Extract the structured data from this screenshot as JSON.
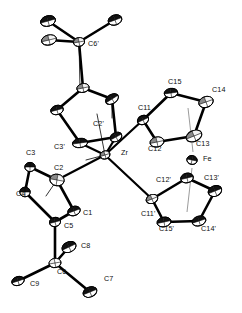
{
  "figure": {
    "kind": "ortep-crystal-structure-diagram",
    "title": "",
    "caption": "",
    "background_color": "#ffffff",
    "line_color": "#000000",
    "label_color": "#0d0d0d",
    "shading_colors": {
      "dark": "#121212",
      "mid": "#8a8a8a",
      "light": "#f2f2f2",
      "white": "#ffffff"
    }
  },
  "structure": {
    "metal_centers": [
      "Zr",
      "Fe"
    ],
    "label_count": 22,
    "atoms": [
      {
        "id": "Zr",
        "label": "Zr",
        "label_x": 121,
        "label_y": 155,
        "x": 105,
        "y": 155,
        "rx": 5.0,
        "ry": 4.0,
        "rot": -18,
        "fill": "mid",
        "kind": "metal"
      },
      {
        "id": "Fe",
        "label": "Fe",
        "label_x": 203,
        "label_y": 161,
        "x": 192,
        "y": 160,
        "rx": 5.2,
        "ry": 4.4,
        "rot": 12,
        "fill": "dark",
        "kind": "metal"
      },
      {
        "id": "C1",
        "label": "C1",
        "label_x": 83,
        "label_y": 215,
        "x": 74,
        "y": 211,
        "rx": 6.4,
        "ry": 4.6,
        "rot": -20,
        "fill": "dark",
        "kind": "ring-cp-lower"
      },
      {
        "id": "C2",
        "label": "C2",
        "label_x": 54,
        "label_y": 170,
        "x": 57,
        "y": 180,
        "rx": 7.2,
        "ry": 5.8,
        "rot": 10,
        "fill": "mid",
        "kind": "ring-cp-lower"
      },
      {
        "id": "C3",
        "label": "C3",
        "label_x": 26,
        "label_y": 155,
        "x": 30,
        "y": 167,
        "rx": 5.2,
        "ry": 4.6,
        "rot": 0,
        "fill": "dark",
        "kind": "ring-cp-lower"
      },
      {
        "id": "C4",
        "label": "C4",
        "label_x": 16,
        "label_y": 196,
        "x": 25,
        "y": 192,
        "rx": 5.2,
        "ry": 4.8,
        "rot": 0,
        "fill": "dark",
        "kind": "ring-cp-lower"
      },
      {
        "id": "C5",
        "label": "C5",
        "label_x": 64,
        "label_y": 228,
        "x": 55,
        "y": 222,
        "rx": 5.6,
        "ry": 4.6,
        "rot": -15,
        "fill": "dark",
        "kind": "ring-cp-lower"
      },
      {
        "id": "C6",
        "label": "C6",
        "label_x": 57,
        "label_y": 274,
        "x": 55,
        "y": 263,
        "rx": 6.0,
        "ry": 4.6,
        "rot": -10,
        "fill": "light",
        "kind": "tbu-lower"
      },
      {
        "id": "C7",
        "label": "C7",
        "label_x": 104,
        "label_y": 281,
        "x": 90,
        "y": 292,
        "rx": 7.2,
        "ry": 5.0,
        "rot": -22,
        "fill": "dark",
        "kind": "tbu-lower"
      },
      {
        "id": "C8",
        "label": "C8",
        "label_x": 81,
        "label_y": 248,
        "x": 69,
        "y": 247,
        "rx": 7.4,
        "ry": 5.2,
        "rot": -25,
        "fill": "dark",
        "kind": "tbu-lower"
      },
      {
        "id": "C9",
        "label": "C9",
        "label_x": 30,
        "label_y": 286,
        "x": 18,
        "y": 281,
        "rx": 6.4,
        "ry": 4.4,
        "rot": -18,
        "fill": "dark",
        "kind": "tbu-lower"
      },
      {
        "id": "C1p",
        "label": "C1'",
        "label_x": 0,
        "label_y": 0,
        "x": 116,
        "y": 137,
        "rx": 6.2,
        "ry": 4.4,
        "rot": -28,
        "fill": "dark",
        "kind": "ring-cp-upper"
      },
      {
        "id": "C2p",
        "label": "C2'",
        "label_x": 93,
        "label_y": 126,
        "x": 112,
        "y": 99,
        "rx": 7.0,
        "ry": 4.6,
        "rot": -32,
        "fill": "dark",
        "kind": "ring-cp-upper"
      },
      {
        "id": "C3p",
        "label": "C3'",
        "label_x": 54,
        "label_y": 149,
        "x": 80,
        "y": 143,
        "rx": 7.6,
        "ry": 4.6,
        "rot": -8,
        "fill": "dark",
        "kind": "ring-cp-upper"
      },
      {
        "id": "C4p",
        "label": "C4'",
        "label_x": 0,
        "label_y": 0,
        "x": 57,
        "y": 110,
        "rx": 6.4,
        "ry": 4.6,
        "rot": -15,
        "fill": "dark",
        "kind": "ring-cp-upper"
      },
      {
        "id": "C5p",
        "label": "C5'",
        "label_x": 0,
        "label_y": 0,
        "x": 83,
        "y": 88,
        "rx": 6.2,
        "ry": 4.4,
        "rot": -12,
        "fill": "mid",
        "kind": "ring-cp-upper"
      },
      {
        "id": "C6p",
        "label": "C6'",
        "label_x": 88,
        "label_y": 46,
        "x": 79,
        "y": 42,
        "rx": 5.6,
        "ry": 4.4,
        "rot": -10,
        "fill": "mid",
        "kind": "tbu-upper"
      },
      {
        "id": "C7p",
        "label": "",
        "label_x": 0,
        "label_y": 0,
        "x": 115,
        "y": 20,
        "rx": 7.0,
        "ry": 5.0,
        "rot": -20,
        "fill": "dark",
        "kind": "tbu-upper"
      },
      {
        "id": "C8p",
        "label": "",
        "label_x": 0,
        "label_y": 0,
        "x": 48,
        "y": 21,
        "rx": 7.6,
        "ry": 5.2,
        "rot": -16,
        "fill": "dark",
        "kind": "tbu-upper"
      },
      {
        "id": "C9p",
        "label": "",
        "label_x": 0,
        "label_y": 0,
        "x": 49,
        "y": 40,
        "rx": 7.6,
        "ry": 5.0,
        "rot": -14,
        "fill": "mid",
        "kind": "tbu-upper"
      },
      {
        "id": "C11",
        "label": "C11",
        "label_x": 138,
        "label_y": 110,
        "x": 143,
        "y": 120,
        "rx": 5.8,
        "ry": 4.4,
        "rot": -25,
        "fill": "dark",
        "kind": "ring-cp-fe-upper"
      },
      {
        "id": "C12",
        "label": "C12",
        "label_x": 148,
        "label_y": 151,
        "x": 157,
        "y": 142,
        "rx": 7.0,
        "ry": 5.0,
        "rot": -12,
        "fill": "mid",
        "kind": "ring-cp-fe-upper"
      },
      {
        "id": "C13",
        "label": "C13",
        "label_x": 196,
        "label_y": 146,
        "x": 194,
        "y": 136,
        "rx": 8.2,
        "ry": 5.4,
        "rot": -22,
        "fill": "mid",
        "kind": "ring-cp-fe-upper"
      },
      {
        "id": "C14",
        "label": "C14",
        "label_x": 212,
        "label_y": 92,
        "x": 206,
        "y": 102,
        "rx": 7.4,
        "ry": 5.4,
        "rot": -20,
        "fill": "mid",
        "kind": "ring-cp-fe-upper"
      },
      {
        "id": "C15",
        "label": "C15",
        "label_x": 168,
        "label_y": 84,
        "x": 171,
        "y": 93,
        "rx": 6.8,
        "ry": 4.6,
        "rot": -8,
        "fill": "dark",
        "kind": "ring-cp-fe-upper"
      },
      {
        "id": "C11p",
        "label": "C11'",
        "label_x": 141,
        "label_y": 216,
        "x": 152,
        "y": 199,
        "rx": 6.0,
        "ry": 4.4,
        "rot": -22,
        "fill": "mid",
        "kind": "ring-cp-fe-lower"
      },
      {
        "id": "C12p",
        "label": "C12'",
        "label_x": 156,
        "label_y": 182,
        "x": 187,
        "y": 178,
        "rx": 6.4,
        "ry": 4.8,
        "rot": -14,
        "fill": "dark",
        "kind": "ring-cp-fe-lower"
      },
      {
        "id": "C13p",
        "label": "C13'",
        "label_x": 204,
        "label_y": 180,
        "x": 215,
        "y": 191,
        "rx": 7.0,
        "ry": 5.2,
        "rot": -22,
        "fill": "dark",
        "kind": "ring-cp-fe-lower"
      },
      {
        "id": "C14p",
        "label": "C14'",
        "label_x": 201,
        "label_y": 231,
        "x": 199,
        "y": 221,
        "rx": 7.0,
        "ry": 4.8,
        "rot": -18,
        "fill": "dark",
        "kind": "ring-cp-fe-lower"
      },
      {
        "id": "C15p",
        "label": "C15'",
        "label_x": 159,
        "label_y": 231,
        "x": 164,
        "y": 222,
        "rx": 7.0,
        "ry": 4.8,
        "rot": -12,
        "fill": "dark",
        "kind": "ring-cp-fe-lower"
      }
    ],
    "bonds": [
      {
        "a": "Zr",
        "b": "C1p",
        "w": 2.2
      },
      {
        "a": "Zr",
        "b": "C3p",
        "w": 2.2
      },
      {
        "a": "Zr",
        "b": "C2",
        "w": 2.2
      },
      {
        "a": "Zr",
        "b": "C11",
        "w": 2.2
      },
      {
        "a": "Zr",
        "b": "C11p",
        "w": 2.2
      },
      {
        "a": "C1",
        "b": "C2",
        "w": 2.6
      },
      {
        "a": "C2",
        "b": "C3",
        "w": 2.6
      },
      {
        "a": "C3",
        "b": "C4",
        "w": 2.6
      },
      {
        "a": "C4",
        "b": "C5",
        "w": 2.6
      },
      {
        "a": "C5",
        "b": "C1",
        "w": 2.6
      },
      {
        "a": "C5",
        "b": "C6",
        "w": 2.6
      },
      {
        "a": "C6",
        "b": "C7",
        "w": 2.6
      },
      {
        "a": "C6",
        "b": "C8",
        "w": 2.6
      },
      {
        "a": "C6",
        "b": "C9",
        "w": 2.6
      },
      {
        "a": "C1p",
        "b": "C2p",
        "w": 2.6
      },
      {
        "a": "C2p",
        "b": "C5p",
        "w": 2.6
      },
      {
        "a": "C5p",
        "b": "C4p",
        "w": 2.6
      },
      {
        "a": "C4p",
        "b": "C3p",
        "w": 2.6
      },
      {
        "a": "C3p",
        "b": "C1p",
        "w": 2.6
      },
      {
        "a": "C5p",
        "b": "C6p",
        "w": 2.6
      },
      {
        "a": "C6p",
        "b": "C7p",
        "w": 2.6
      },
      {
        "a": "C6p",
        "b": "C8p",
        "w": 2.6
      },
      {
        "a": "C6p",
        "b": "C9p",
        "w": 2.6
      },
      {
        "a": "C11",
        "b": "C12",
        "w": 2.6
      },
      {
        "a": "C12",
        "b": "C13",
        "w": 2.6
      },
      {
        "a": "C13",
        "b": "C14",
        "w": 2.6
      },
      {
        "a": "C14",
        "b": "C15",
        "w": 2.6
      },
      {
        "a": "C15",
        "b": "C11",
        "w": 2.6
      },
      {
        "a": "C11p",
        "b": "C12p",
        "w": 2.6
      },
      {
        "a": "C12p",
        "b": "C13p",
        "w": 2.6
      },
      {
        "a": "C13p",
        "b": "C14p",
        "w": 2.6
      },
      {
        "a": "C14p",
        "b": "C15p",
        "w": 2.6
      },
      {
        "a": "C15p",
        "b": "C11p",
        "w": 2.6
      }
    ],
    "centroid_lines": [
      {
        "x1": 188,
        "y1": 108,
        "x2": 193,
        "y2": 152
      },
      {
        "x1": 192,
        "y1": 168,
        "x2": 187,
        "y2": 212
      }
    ]
  }
}
